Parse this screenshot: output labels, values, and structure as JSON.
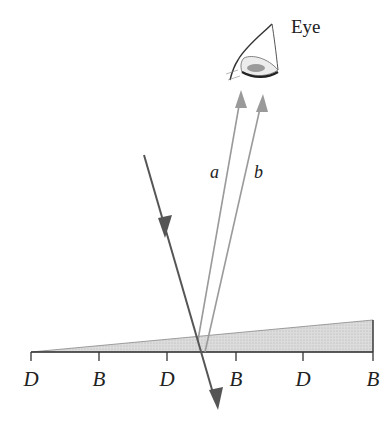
{
  "figure": {
    "eye_label": "Eye",
    "rays": [
      {
        "name": "incident",
        "label": ""
      },
      {
        "name": "reflected-a",
        "label": "a"
      },
      {
        "name": "reflected-b",
        "label": "b"
      }
    ],
    "ticks": [
      {
        "label": "D",
        "x": 31
      },
      {
        "label": "B",
        "x": 99
      },
      {
        "label": "D",
        "x": 167
      },
      {
        "label": "B",
        "x": 236
      },
      {
        "label": "D",
        "x": 303
      },
      {
        "label": "B",
        "x": 373
      }
    ],
    "colors": {
      "incident_ray": "#555555",
      "reflected_rays": "#999999",
      "wedge_fill": "#d4d4d4",
      "baseline": "#333333",
      "text": "#222222"
    }
  }
}
